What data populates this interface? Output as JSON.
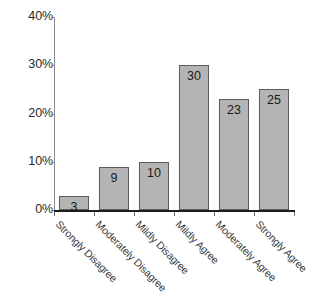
{
  "chart_data": {
    "type": "bar",
    "title": "",
    "subtitle": "",
    "xlabel": "",
    "ylabel": "",
    "categories": [
      "Strongly Disagree",
      "Moderately Disagree",
      "Mildly Disagree",
      "Mildly Agree",
      "Moderately Agree",
      "Strongly Agree"
    ],
    "values": [
      3,
      9,
      10,
      30,
      23,
      25
    ],
    "data_labels": [
      "3",
      "9",
      "10",
      "30",
      "23",
      "25"
    ],
    "ylim": [
      0,
      40
    ],
    "y_ticks": [
      0,
      10,
      20,
      30,
      40
    ],
    "y_tick_labels": [
      "0%",
      "10%",
      "20%",
      "30%",
      "40%"
    ],
    "grid": false,
    "legend": false,
    "legend_position": "none",
    "bar_color": "#b4b4b4",
    "bar_edge_color": "#5e5e5e",
    "axis_color": "#1c1c1c",
    "text_color": "#2b2b2b",
    "units": "percent",
    "label_rotation": -45
  }
}
